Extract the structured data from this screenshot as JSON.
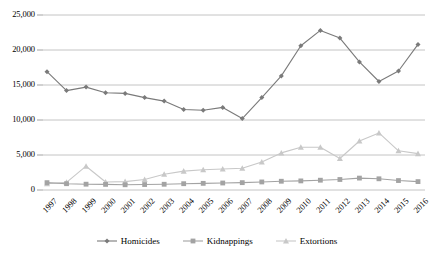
{
  "chart_data": {
    "type": "line",
    "title": "",
    "subtitle": "",
    "xlabel": "",
    "ylabel": "",
    "categories": [
      "1997",
      "1998",
      "1999",
      "2000",
      "2001",
      "2002",
      "2003",
      "2004",
      "2005",
      "2006",
      "2007",
      "2008",
      "2009",
      "2010",
      "2011",
      "2012",
      "2013",
      "2014",
      "2015",
      "2016"
    ],
    "ylim": [
      0,
      25000
    ],
    "yticks": [
      0,
      5000,
      10000,
      15000,
      20000,
      25000
    ],
    "ytick_labels": [
      "0",
      "5,000",
      "10,000",
      "15,000",
      "20,000",
      "25,000"
    ],
    "grid": true,
    "legend_position": "bottom",
    "series": [
      {
        "name": "Homicides",
        "color": "#7a7a7a",
        "marker": "diamond",
        "values": [
          16900,
          14200,
          14700,
          13900,
          13800,
          13200,
          12700,
          11500,
          11400,
          11800,
          10200,
          13200,
          16300,
          20600,
          22800,
          21700,
          18300,
          15500,
          17000,
          20800
        ]
      },
      {
        "name": "Kidnappings",
        "color": "#a3a3a3",
        "marker": "square",
        "values": [
          1050,
          900,
          830,
          800,
          750,
          780,
          820,
          900,
          950,
          1000,
          1050,
          1150,
          1250,
          1300,
          1400,
          1500,
          1700,
          1600,
          1350,
          1200
        ]
      },
      {
        "name": "Extortions",
        "color": "#c8c8c8",
        "marker": "triangle",
        "values": [
          900,
          1100,
          3400,
          1150,
          1200,
          1500,
          2250,
          2700,
          2900,
          3000,
          3100,
          4000,
          5300,
          6100,
          6100,
          4500,
          7000,
          8150,
          5600,
          5200
        ]
      }
    ]
  },
  "legend": {
    "items": [
      {
        "label": "Homicides"
      },
      {
        "label": "Kidnappings"
      },
      {
        "label": "Extortions"
      }
    ]
  },
  "axes": {
    "y": {
      "labels": [
        "25,000",
        "20,000",
        "15,000",
        "10,000",
        "5,000",
        "0"
      ]
    },
    "x": {
      "labels": [
        "1997",
        "1998",
        "1999",
        "2000",
        "2001",
        "2002",
        "2003",
        "2004",
        "2005",
        "2006",
        "2007",
        "2008",
        "2009",
        "2010",
        "2011",
        "2012",
        "2013",
        "2014",
        "2015",
        "2016"
      ]
    }
  }
}
